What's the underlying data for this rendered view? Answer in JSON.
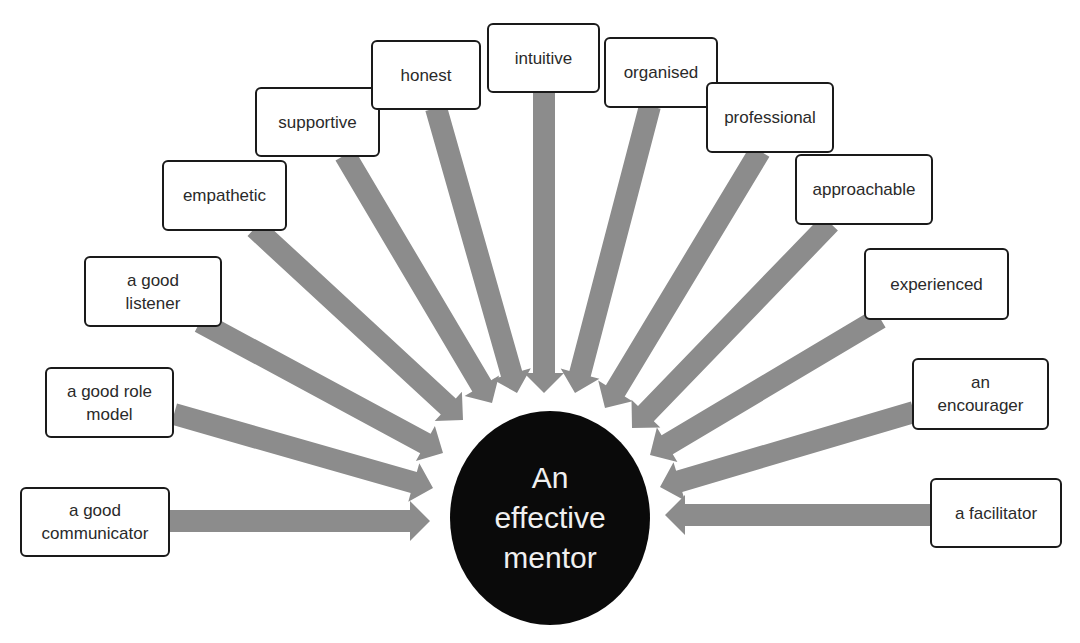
{
  "diagram": {
    "title": "An effective mentor",
    "center": {
      "label": "An\neffective\nmentor",
      "cx": 550,
      "cy": 518,
      "rx": 100,
      "ry": 107,
      "fill": "#0a0a0a",
      "text_color": "#f0f0f0"
    },
    "arrow_color": "#8c8c8c",
    "shaft_width": 22,
    "head_width": 40,
    "head_length": 20,
    "qualities": [
      {
        "label": "a good\ncommunicator",
        "box": [
          20,
          487,
          150,
          70
        ],
        "from": [
          170,
          521
        ],
        "to": [
          430,
          521
        ]
      },
      {
        "label": "a good role\nmodel",
        "box": [
          45,
          367,
          129,
          71
        ],
        "from": [
          174,
          414
        ],
        "to": [
          433,
          488
        ]
      },
      {
        "label": "a good\nlistener",
        "box": [
          84,
          256,
          138,
          71
        ],
        "from": [
          200,
          322
        ],
        "to": [
          443,
          453
        ]
      },
      {
        "label": "empathetic",
        "box": [
          162,
          160,
          125,
          71
        ],
        "from": [
          255,
          228
        ],
        "to": [
          463,
          420
        ]
      },
      {
        "label": "supportive",
        "box": [
          255,
          87,
          125,
          70
        ],
        "from": [
          345,
          155
        ],
        "to": [
          492,
          403
        ]
      },
      {
        "label": "honest",
        "box": [
          371,
          40,
          110,
          70
        ],
        "from": [
          436,
          108
        ],
        "to": [
          517,
          393
        ]
      },
      {
        "label": "intuitive",
        "box": [
          487,
          23,
          113,
          70
        ],
        "from": [
          544,
          93
        ],
        "to": [
          544,
          393
        ]
      },
      {
        "label": "organised",
        "box": [
          604,
          37,
          114,
          71
        ],
        "from": [
          650,
          106
        ],
        "to": [
          575,
          393
        ]
      },
      {
        "label": "professional",
        "box": [
          706,
          82,
          128,
          71
        ],
        "from": [
          760,
          151
        ],
        "to": [
          605,
          408
        ]
      },
      {
        "label": "approachable",
        "box": [
          795,
          154,
          138,
          71
        ],
        "from": [
          830,
          223
        ],
        "to": [
          632,
          428
        ]
      },
      {
        "label": "experienced",
        "box": [
          864,
          248,
          145,
          72
        ],
        "from": [
          880,
          318
        ],
        "to": [
          650,
          455
        ]
      },
      {
        "label": "an\nencourager",
        "box": [
          912,
          358,
          137,
          72
        ],
        "from": [
          914,
          412
        ],
        "to": [
          660,
          487
        ]
      },
      {
        "label": "a facilitator",
        "box": [
          930,
          478,
          132,
          70
        ],
        "from": [
          932,
          515
        ],
        "to": [
          665,
          515
        ]
      }
    ]
  }
}
